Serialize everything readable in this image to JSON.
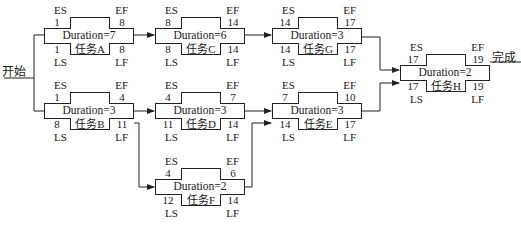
{
  "diagram": {
    "type": "activity-on-node network",
    "start_label": "开始",
    "end_label": "完成",
    "field_labels": {
      "es": "ES",
      "ef": "EF",
      "ls": "LS",
      "lf": "LF"
    },
    "nodes": {
      "A": {
        "name": "任务A",
        "duration": "Duration=7",
        "es": "1",
        "ef": "8",
        "ls": "1",
        "lf": "8"
      },
      "C": {
        "name": "任务C",
        "duration": "Duration=6",
        "es": "8",
        "ef": "14",
        "ls": "8",
        "lf": "14"
      },
      "G": {
        "name": "任务G",
        "duration": "Duration=3",
        "es": "14",
        "ef": "17",
        "ls": "14",
        "lf": "17"
      },
      "H": {
        "name": "任务H",
        "duration": "Duration=2",
        "es": "17",
        "ef": "19",
        "ls": "17",
        "lf": "19"
      },
      "B": {
        "name": "任务B",
        "duration": "Duration=3",
        "es": "1",
        "ef": "4",
        "ls": "8",
        "lf": "11"
      },
      "D": {
        "name": "任务D",
        "duration": "Duration=3",
        "es": "4",
        "ef": "7",
        "ls": "11",
        "lf": "14"
      },
      "E": {
        "name": "任务E",
        "duration": "Duration=3",
        "es": "7",
        "ef": "10",
        "ls": "14",
        "lf": "17"
      },
      "F": {
        "name": "任务F",
        "duration": "Duration=2",
        "es": "4",
        "ef": "6",
        "ls": "12",
        "lf": "14"
      }
    },
    "edges": [
      [
        "start",
        "A"
      ],
      [
        "start",
        "B"
      ],
      [
        "A",
        "C"
      ],
      [
        "C",
        "G"
      ],
      [
        "G",
        "H"
      ],
      [
        "B",
        "D"
      ],
      [
        "B",
        "F"
      ],
      [
        "D",
        "E"
      ],
      [
        "F",
        "E"
      ],
      [
        "E",
        "H"
      ],
      [
        "H",
        "end"
      ]
    ]
  }
}
